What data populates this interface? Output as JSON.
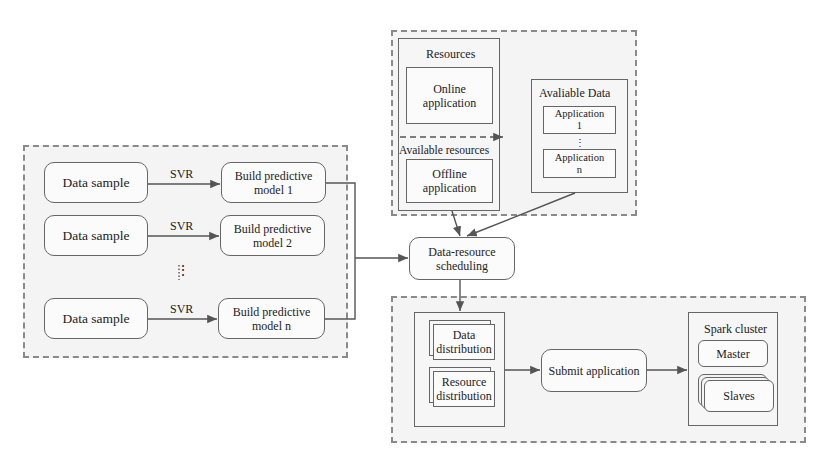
{
  "left_group": {
    "rows": [
      {
        "sample": "Data sample",
        "method": "SVR",
        "model": "Build predictive\nmodel 1"
      },
      {
        "sample": "Data sample",
        "method": "SVR",
        "model": "Build predictive\nmodel 2"
      },
      {
        "sample": "Data sample",
        "method": "SVR",
        "model": "Build predictive\nmodel n"
      }
    ],
    "ellipsis": "⋮"
  },
  "top_group": {
    "resources_title": "Resources",
    "online": "Online\napplication",
    "available_resources_title": "Available resources",
    "offline": "Offline\napplication",
    "available_data_title": "Avaliable Data",
    "app_1": "Application\n1",
    "app_ellipsis": "⋮",
    "app_n": "Application\nn"
  },
  "scheduler": {
    "label": "Data-resource\nscheduling"
  },
  "bottom_group": {
    "data_distribution": "Data\ndistribution",
    "resource_distribution": "Resource\ndistribution",
    "submit": "Submit application",
    "spark_title": "Spark cluster",
    "master": "Master",
    "slaves": "Slaves"
  }
}
